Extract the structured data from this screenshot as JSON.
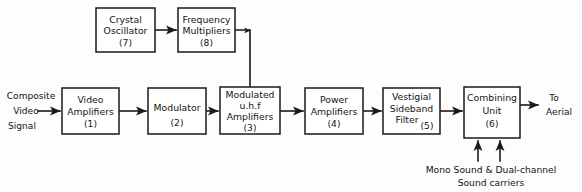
{
  "diagram": {
    "background_color": "#fdfdfd",
    "line_color": "#1a1a1a",
    "blocks": [
      {
        "id": "crystal-oscillator",
        "number": "(7)",
        "lines": [
          "Crystal",
          "Oscillator"
        ],
        "x": 96,
        "y": 8,
        "w": 59,
        "h": 44
      },
      {
        "id": "frequency-multipliers",
        "number": "(8)",
        "lines": [
          "Frequency",
          "Multipliers"
        ],
        "x": 178,
        "y": 8,
        "w": 57,
        "h": 44
      },
      {
        "id": "video-amplifiers",
        "number": "(1)",
        "lines": [
          "Video",
          "Amplifiers"
        ],
        "x": 62,
        "y": 88,
        "w": 57,
        "h": 46
      },
      {
        "id": "modulator",
        "number": "(2)",
        "lines": [
          "Modulator"
        ],
        "x": 148,
        "y": 88,
        "w": 58,
        "h": 46
      },
      {
        "id": "modulated-uhf-amplifiers",
        "number": "(3)",
        "lines": [
          "Modulated",
          "u.h.f",
          "Amplifiers"
        ],
        "x": 220,
        "y": 87,
        "w": 60,
        "h": 47
      },
      {
        "id": "power-amplifiers",
        "number": "(4)",
        "lines": [
          "Power",
          "Amplifiers"
        ],
        "x": 305,
        "y": 88,
        "w": 58,
        "h": 46
      },
      {
        "id": "vestigial-sideband-filter",
        "number": "(5)",
        "lines": [
          "Vestigial",
          "Sideband",
          "Filter"
        ],
        "x": 383,
        "y": 88,
        "w": 57,
        "h": 46
      },
      {
        "id": "combining-unit",
        "number": "(6)",
        "lines": [
          "Combining",
          "Unit"
        ],
        "x": 464,
        "y": 87,
        "w": 56,
        "h": 51
      }
    ],
    "labels": {
      "input": {
        "lines": [
          "Composite",
          "Video",
          "Signal"
        ],
        "x": 31,
        "y": 94
      },
      "output": {
        "lines": [
          "To",
          "Aerial"
        ],
        "x": 552,
        "y": 103
      },
      "bottom_caption": {
        "lines": [
          "Mono Sound & Dual-channel",
          "Sound carriers"
        ],
        "x": 491,
        "y": 167
      }
    }
  }
}
